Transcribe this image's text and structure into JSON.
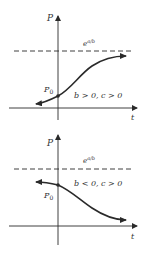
{
  "diagrams": [
    {
      "id": "top",
      "y_axis_label": "P",
      "x_axis_label": "t",
      "asymptote_label_base": "e",
      "asymptote_label_exp": "a/b",
      "initial_point_label_base": "P",
      "initial_point_label_sub": "0",
      "condition_label": "b > 0, c > 0",
      "curve_direction": "increasing"
    },
    {
      "id": "bottom",
      "y_axis_label": "P",
      "x_axis_label": "t",
      "asymptote_label_base": "e",
      "asymptote_label_exp": "a/b",
      "initial_point_label_base": "P",
      "initial_point_label_sub": "0",
      "condition_label": "b < 0, c > 0",
      "curve_direction": "decreasing"
    }
  ],
  "colors": {
    "line": "#2a2a2a",
    "text": "#333333",
    "background": "#ffffff"
  }
}
